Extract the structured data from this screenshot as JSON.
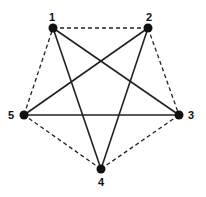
{
  "diagram": {
    "nodes": [
      {
        "id": "1",
        "label": "1",
        "x": 53,
        "y": 28,
        "lx": 52,
        "ly": 21
      },
      {
        "id": "2",
        "label": "2",
        "x": 148,
        "y": 28,
        "lx": 149,
        "ly": 21
      },
      {
        "id": "3",
        "label": "3",
        "x": 179,
        "y": 115,
        "lx": 191,
        "ly": 119
      },
      {
        "id": "4",
        "label": "4",
        "x": 101,
        "y": 169,
        "lx": 101,
        "ly": 186
      },
      {
        "id": "5",
        "label": "5",
        "x": 24,
        "y": 115,
        "lx": 11,
        "ly": 119
      }
    ],
    "edges_solid": [
      [
        "1",
        "3"
      ],
      [
        "1",
        "4"
      ],
      [
        "2",
        "5"
      ],
      [
        "2",
        "4"
      ],
      [
        "5",
        "3"
      ]
    ],
    "edges_dashed": [
      [
        "1",
        "2"
      ],
      [
        "2",
        "3"
      ],
      [
        "3",
        "4"
      ],
      [
        "4",
        "5"
      ],
      [
        "5",
        "1"
      ]
    ],
    "colors": {
      "edge": "#222222",
      "node": "#111111"
    }
  }
}
